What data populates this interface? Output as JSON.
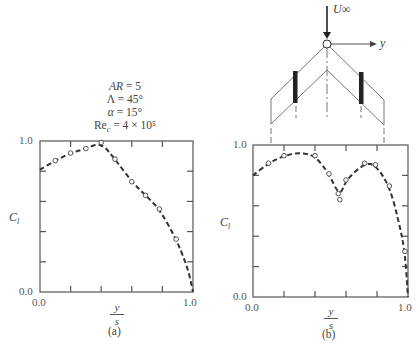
{
  "figure": {
    "parameters": [
      {
        "label": "AR",
        "value": "= 5"
      },
      {
        "label": "Λ",
        "value": "= 45°"
      },
      {
        "label": "α",
        "value": "= 15°"
      },
      {
        "label": "Rec",
        "value": "= 4 × 10⁵"
      }
    ],
    "diagram": {
      "freestream_label": "U∞",
      "axis_label": "y"
    },
    "panel_a": {
      "caption": "(a)",
      "ylabel": "C_l",
      "xlabel_num": "y",
      "xlabel_den": "s",
      "x_ticks": [
        "0.0",
        "1.0"
      ],
      "y_ticks": [
        "0.0",
        "1.0"
      ]
    },
    "panel_b": {
      "caption": "(b)",
      "ylabel": "C_l",
      "xlabel_num": "y",
      "xlabel_den": "s",
      "x_ticks": [
        "0.0",
        "1.0"
      ],
      "y_ticks": [
        "0.0",
        "1.0"
      ]
    }
  },
  "chart_data": [
    {
      "type": "line",
      "title": "(a) Spanwise lift distribution, swept wing without fences",
      "xlabel": "y/s",
      "ylabel": "C_l",
      "xlim": [
        0.0,
        1.0
      ],
      "ylim": [
        0.0,
        1.0
      ],
      "grid": false,
      "series": [
        {
          "name": "measured (markers)",
          "style": "open-circle",
          "x": [
            0.1,
            0.2,
            0.3,
            0.4,
            0.49,
            0.6,
            0.69,
            0.78,
            0.89
          ],
          "y": [
            0.87,
            0.92,
            0.95,
            0.99,
            0.88,
            0.73,
            0.64,
            0.55,
            0.35
          ]
        },
        {
          "name": "fit (dashed)",
          "style": "dashed",
          "x": [
            0.0,
            0.1,
            0.2,
            0.3,
            0.4,
            0.49,
            0.6,
            0.69,
            0.78,
            0.89,
            0.95,
            0.98,
            1.0
          ],
          "y": [
            0.81,
            0.87,
            0.92,
            0.95,
            0.99,
            0.88,
            0.73,
            0.64,
            0.55,
            0.35,
            0.2,
            0.1,
            0.0
          ]
        }
      ]
    },
    {
      "type": "line",
      "title": "(b) Spanwise lift distribution, swept wing with fences",
      "xlabel": "y/s",
      "ylabel": "C_l",
      "xlim": [
        0.0,
        1.0
      ],
      "ylim": [
        0.0,
        1.0
      ],
      "grid": false,
      "series": [
        {
          "name": "measured (markers)",
          "style": "open-circle",
          "x": [
            0.1,
            0.2,
            0.4,
            0.49,
            0.55,
            0.56,
            0.6,
            0.72,
            0.79,
            0.88,
            0.98
          ],
          "y": [
            0.88,
            0.93,
            0.93,
            0.81,
            0.68,
            0.64,
            0.77,
            0.88,
            0.87,
            0.73,
            0.3
          ]
        },
        {
          "name": "fit (dashed)",
          "style": "dashed",
          "x": [
            0.0,
            0.1,
            0.2,
            0.3,
            0.4,
            0.49,
            0.56,
            0.6,
            0.72,
            0.79,
            0.88,
            0.94,
            0.98,
            1.0
          ],
          "y": [
            0.8,
            0.88,
            0.93,
            0.95,
            0.93,
            0.81,
            0.66,
            0.77,
            0.88,
            0.87,
            0.73,
            0.5,
            0.3,
            0.0
          ]
        }
      ]
    }
  ]
}
